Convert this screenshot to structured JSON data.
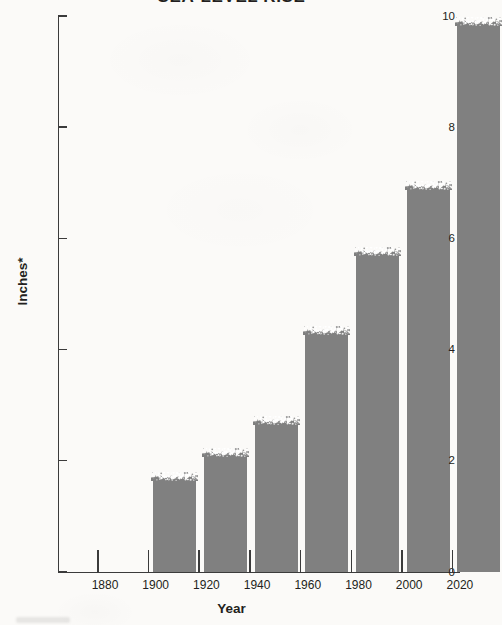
{
  "chart_data": {
    "type": "bar",
    "title": "SEA-LEVEL RISE",
    "xlabel": "Year",
    "ylabel": "Inches*",
    "categories": [
      "1880",
      "1900",
      "1920",
      "1940",
      "1960",
      "1980",
      "2000",
      "2020"
    ],
    "values": [
      null,
      1.67,
      2.1,
      2.68,
      4.3,
      5.72,
      6.91,
      9.85
    ],
    "xtick_labels": [
      "1880",
      "1900",
      "1920",
      "1940",
      "1960",
      "1980",
      "2000",
      "2020"
    ],
    "ytick_labels": [
      "0",
      "2",
      "4",
      "6",
      "8",
      "10"
    ],
    "ytick_values": [
      0,
      2,
      4,
      6,
      8,
      10
    ],
    "ylim": [
      0,
      10
    ],
    "grid": false,
    "legend": false,
    "bar_color": "#808080",
    "axis_color": "#3b3b3b",
    "background_color": "#fbfaf8"
  }
}
